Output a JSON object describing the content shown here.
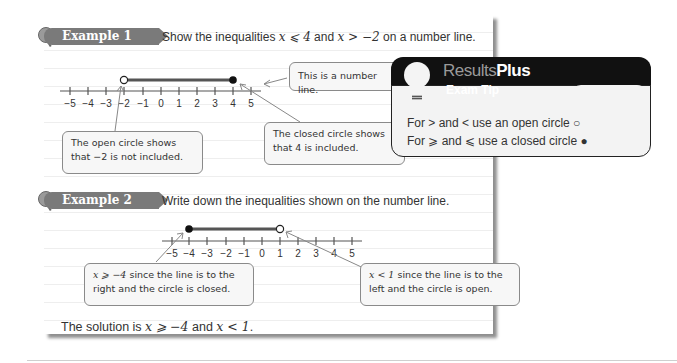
{
  "example1": {
    "tab_label": "Example 1",
    "prompt": {
      "before": "Show the inequalities ",
      "ineq1": "x ⩽ 4",
      "mid": " and ",
      "ineq2": "x > −2",
      "after": " on a number line."
    },
    "number_line": {
      "ticks": [
        "−5",
        "−4",
        "−3",
        "−2",
        "−1",
        "0",
        "1",
        "2",
        "3",
        "4",
        "5"
      ],
      "open_circle_at": -2,
      "closed_circle_at": 4
    },
    "callouts": {
      "number_line": "This is a number line.",
      "open_circle_line1": "The open circle shows",
      "open_circle_line2": "that −2 is not included.",
      "closed_circle_line1": "The closed circle shows",
      "closed_circle_line2": "that 4 is included."
    }
  },
  "exam_tip": {
    "brand_results": "Results",
    "brand_plus": "Plus",
    "subtitle": "Exam Tip",
    "line1": "For > and < use an open circle ○",
    "line2": "For ⩾ and ⩽ use a closed circle ●",
    "icon": "lightbulb-icon"
  },
  "example2": {
    "tab_label": "Example 2",
    "prompt": "Write down the inequalities shown on the number line.",
    "number_line": {
      "ticks": [
        "−5",
        "−4",
        "−3",
        "−2",
        "−1",
        "0",
        "1",
        "2",
        "3",
        "4",
        "5"
      ],
      "closed_circle_at": -4,
      "open_circle_at": 1
    },
    "callouts": {
      "left_math": "x ⩾ −4",
      "left_line1_rest": " since the line is to the",
      "left_line2": "right and the circle is closed.",
      "right_math": "x < 1",
      "right_line1_rest": " since the line is to the",
      "right_line2": "left and the circle is open."
    },
    "solution": {
      "before": "The solution is ",
      "ineq1": "x ⩾ −4",
      "mid": " and ",
      "ineq2": "x < 1",
      "after": "."
    }
  }
}
